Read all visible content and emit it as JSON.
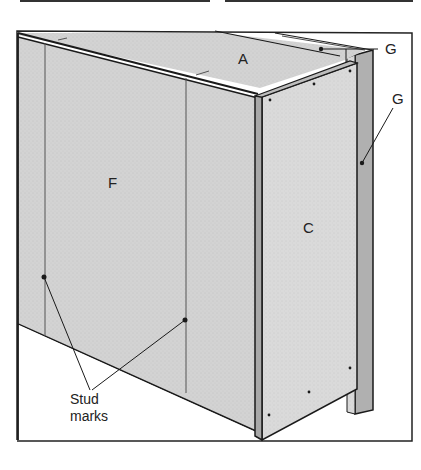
{
  "figure": {
    "type": "technical-illustration",
    "labels": {
      "top_panel": "A",
      "front_panel": "F",
      "side_panel": "C",
      "strip_top": "G",
      "strip_side": "G",
      "callout_line1": "Stud",
      "callout_line2": "marks"
    },
    "colors": {
      "panel_fill": "#d4d4d4",
      "panel_fill_side": "#dcdcdc",
      "strip_fill": "#b5b5b5",
      "line": "#1a1a1a",
      "background": "#ffffff"
    }
  }
}
